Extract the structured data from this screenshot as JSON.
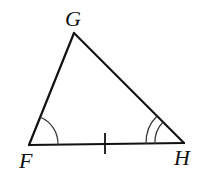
{
  "diagram": {
    "type": "triangle",
    "vertices": [
      {
        "name": "G",
        "label": "G",
        "x": 74,
        "y": 33,
        "label_x": 65,
        "label_y": 26
      },
      {
        "name": "F",
        "label": "F",
        "x": 29,
        "y": 145,
        "label_x": 19,
        "label_y": 168
      },
      {
        "name": "H",
        "label": "H",
        "x": 184,
        "y": 143,
        "label_x": 174,
        "label_y": 165
      }
    ],
    "sides": [
      {
        "name": "FG",
        "from": "F",
        "to": "G"
      },
      {
        "name": "GH",
        "from": "G",
        "to": "H"
      },
      {
        "name": "FH",
        "from": "F",
        "to": "H",
        "tick_marks": 1
      }
    ],
    "angle_marks": [
      {
        "vertex": "F",
        "arcs": 1
      },
      {
        "vertex": "H",
        "arcs": 2
      }
    ],
    "colors": {
      "stroke": "#111111",
      "arc": "#333333",
      "background": "#ffffff"
    }
  }
}
